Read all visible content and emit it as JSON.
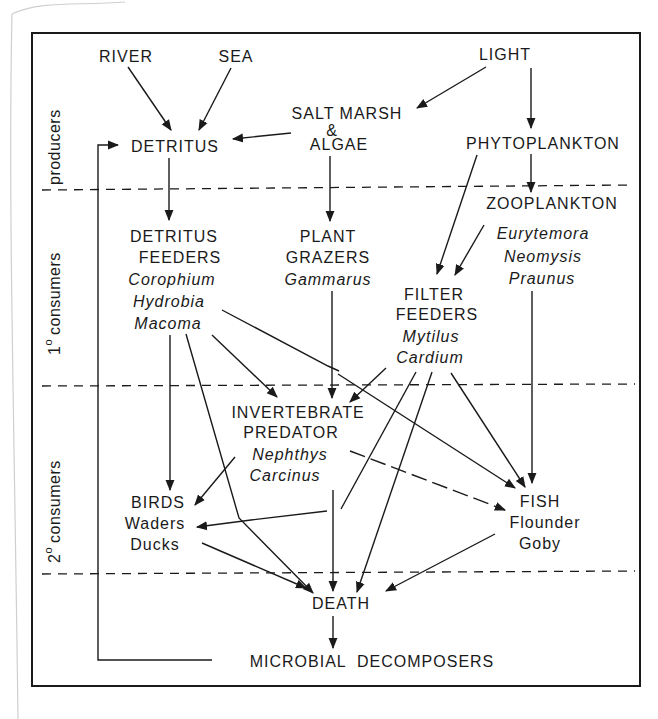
{
  "diagram": {
    "bands": [
      {
        "id": "producers",
        "label": "producers",
        "superscript": ""
      },
      {
        "id": "primary",
        "label": "consumers",
        "prefix": "1",
        "superscript": "o"
      },
      {
        "id": "secondary",
        "label": "consumers",
        "prefix": "2",
        "superscript": "o"
      }
    ],
    "nodes": {
      "river": {
        "lines": [
          "RIVER"
        ]
      },
      "sea": {
        "lines": [
          "SEA"
        ]
      },
      "light": {
        "lines": [
          "LIGHT"
        ]
      },
      "saltmarsh": {
        "lines": [
          "SALT MARSH",
          "&",
          "ALGAE"
        ]
      },
      "detritus": {
        "lines": [
          "DETRITUS"
        ]
      },
      "phytoplankton": {
        "lines": [
          "PHYTOPLANKTON"
        ]
      },
      "zooplankton": {
        "lines": [
          "ZOOPLANKTON"
        ],
        "species": [
          "Eurytemora",
          "Neomysis",
          "Praunus"
        ]
      },
      "detritus_feeders": {
        "lines": [
          "DETRITUS",
          "FEEDERS"
        ],
        "species": [
          "Corophium",
          "Hydrobia",
          "Macoma"
        ]
      },
      "plant_grazers": {
        "lines": [
          "PLANT",
          "GRAZERS"
        ],
        "species": [
          "Gammarus"
        ]
      },
      "filter_feeders": {
        "lines": [
          "FILTER",
          "FEEDERS"
        ],
        "species": [
          "Mytilus",
          "Cardium"
        ]
      },
      "invertebrate_predator": {
        "lines": [
          "INVERTEBRATE",
          "PREDATOR"
        ],
        "species": [
          "Nephthys",
          "Carcinus"
        ]
      },
      "birds": {
        "lines": [
          "BIRDS"
        ],
        "species": [
          "Waders",
          "Ducks"
        ]
      },
      "fish": {
        "lines": [
          "FISH"
        ],
        "species": [
          "Flounder",
          "Goby"
        ]
      },
      "death": {
        "lines": [
          "DEATH"
        ]
      },
      "microbial": {
        "lines": [
          "MICROBIAL  DECOMPOSERS"
        ]
      }
    },
    "edges": [
      {
        "from": "river",
        "to": "detritus"
      },
      {
        "from": "sea",
        "to": "detritus"
      },
      {
        "from": "saltmarsh",
        "to": "detritus"
      },
      {
        "from": "light",
        "to": "saltmarsh"
      },
      {
        "from": "light",
        "to": "phytoplankton"
      },
      {
        "from": "phytoplankton",
        "to": "zooplankton"
      },
      {
        "from": "phytoplankton",
        "to": "filter_feeders"
      },
      {
        "from": "zooplankton",
        "to": "filter_feeders"
      },
      {
        "from": "zooplankton",
        "to": "fish"
      },
      {
        "from": "detritus",
        "to": "detritus_feeders"
      },
      {
        "from": "saltmarsh",
        "to": "plant_grazers"
      },
      {
        "from": "detritus_feeders",
        "to": "birds"
      },
      {
        "from": "detritus_feeders",
        "to": "invertebrate_predator"
      },
      {
        "from": "detritus_feeders",
        "to": "fish"
      },
      {
        "from": "detritus_feeders",
        "to": "death"
      },
      {
        "from": "plant_grazers",
        "to": "invertebrate_predator"
      },
      {
        "from": "filter_feeders",
        "to": "invertebrate_predator"
      },
      {
        "from": "filter_feeders",
        "to": "birds"
      },
      {
        "from": "filter_feeders",
        "to": "death"
      },
      {
        "from": "filter_feeders",
        "to": "fish"
      },
      {
        "from": "invertebrate_predator",
        "to": "birds"
      },
      {
        "from": "invertebrate_predator",
        "to": "fish"
      },
      {
        "from": "invertebrate_predator",
        "to": "death"
      },
      {
        "from": "birds",
        "to": "death"
      },
      {
        "from": "fish",
        "to": "death"
      },
      {
        "from": "death",
        "to": "microbial"
      },
      {
        "from": "microbial",
        "to": "detritus"
      }
    ]
  }
}
